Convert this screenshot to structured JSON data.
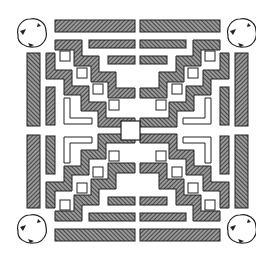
{
  "diagram": {
    "colors": {
      "background": "#ffffff",
      "ink": "#222222",
      "hatch": "#3a3a3a",
      "bed_fill": "#8c8c8c"
    },
    "elements": {
      "trees": [
        {
          "id": "tree-top-left",
          "cx": 32,
          "cy": 33,
          "r": 15
        },
        {
          "id": "tree-top-right",
          "cx": 242,
          "cy": 33,
          "r": 15
        },
        {
          "id": "tree-bottom-left",
          "cx": 32,
          "cy": 229,
          "r": 15
        },
        {
          "id": "tree-bottom-right",
          "cx": 242,
          "cy": 229,
          "r": 15
        }
      ],
      "center_square": {
        "x": 121,
        "y": 121,
        "w": 19,
        "h": 19
      },
      "quadrants": [
        "top-left",
        "top-right",
        "bottom-left",
        "bottom-right"
      ]
    }
  }
}
